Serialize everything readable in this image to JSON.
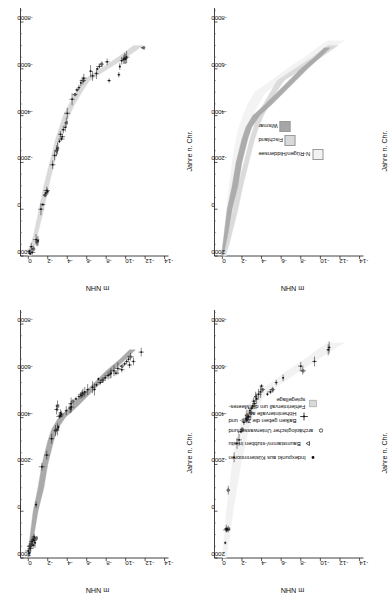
{
  "figure": {
    "axis_titles": {
      "x": "Jahre n. Chr.",
      "y": "m NHN"
    },
    "x_ticks": [
      "2000",
      "0",
      "-2000",
      "-4000",
      "-6000",
      "-8000"
    ],
    "x_tick_values": [
      2000,
      0,
      -2000,
      -4000,
      -6000,
      -8000
    ],
    "y_ticks": [
      "0",
      "-2",
      "-4",
      "-6",
      "-8",
      "-10",
      "-12",
      "-14"
    ],
    "y_tick_values": [
      0,
      -2,
      -4,
      -6,
      -8,
      -10,
      -12,
      -14
    ],
    "xlim": [
      2000,
      -8600
    ],
    "ylim": [
      0.8,
      -14.4
    ]
  },
  "panels": [
    {
      "id": "wismar",
      "title": "Wismar"
    },
    {
      "id": "fischland",
      "title": "Fischland"
    },
    {
      "id": "nruegen",
      "title": "N-Rügen/\nHiddensee"
    },
    {
      "id": "vergleich",
      "title": "Vergleich"
    }
  ],
  "legend_compare": {
    "items": [
      {
        "label": "N-Rügen/Hiddensee",
        "color": "#f2f2f2"
      },
      {
        "label": "Fischland",
        "color": "#d9d9d9"
      },
      {
        "label": "Wismar",
        "color": "#a6a6a6"
      }
    ]
  },
  "legend_symbols": {
    "items": [
      {
        "glyph": "dot",
        "label": "Indexpunkt aus Küstenmooren"
      },
      {
        "glyph": "triangle",
        "label": "Baumstamm/-stubben in situ"
      },
      {
        "glyph": "circle",
        "label": "archäologischer Unterwasserfund"
      },
      {
        "glyph": "cross",
        "label": "Balken geben die Zeit- und\nHöhenintervalle an"
      },
      {
        "glyph": "band",
        "label": "Fehlerintervall um die Meeres-\nspiegellage"
      }
    ]
  },
  "chart_data": {
    "type": "scatter",
    "xlabel": "Jahre n. Chr.",
    "ylabel": "m NHN",
    "xlim": [
      2000,
      -8600
    ],
    "ylim": [
      0.8,
      -14.4
    ],
    "grid": false,
    "legend_position": "inset",
    "series": [
      {
        "name": "Wismar",
        "panel": "wismar",
        "band_color": "#a6a6a6",
        "band_upper": [
          [
            2000,
            0.1
          ],
          [
            1000,
            -0.2
          ],
          [
            0,
            -0.5
          ],
          [
            -1000,
            -1.0
          ],
          [
            -2000,
            -1.4
          ],
          [
            -3000,
            -2.0
          ],
          [
            -3500,
            -2.4
          ],
          [
            -4000,
            -3.1
          ],
          [
            -4500,
            -4.4
          ],
          [
            -5000,
            -5.6
          ],
          [
            -5500,
            -6.8
          ],
          [
            -6000,
            -8.0
          ],
          [
            -6500,
            -9.4
          ],
          [
            -6900,
            -10.4
          ]
        ],
        "band_lower": [
          [
            2000,
            -0.1
          ],
          [
            1000,
            -0.6
          ],
          [
            0,
            -1.0
          ],
          [
            -1000,
            -1.6
          ],
          [
            -2000,
            -2.0
          ],
          [
            -3000,
            -2.6
          ],
          [
            -3500,
            -3.0
          ],
          [
            -4000,
            -3.8
          ],
          [
            -4500,
            -5.1
          ],
          [
            -5000,
            -6.3
          ],
          [
            -5500,
            -7.5
          ],
          [
            -6000,
            -8.7
          ],
          [
            -6500,
            -10.0
          ],
          [
            -6900,
            -11.0
          ]
        ],
        "points": [
          [
            1800,
            -0.1
          ],
          [
            1700,
            0.0
          ],
          [
            1600,
            -0.2
          ],
          [
            1500,
            -0.1
          ],
          [
            1450,
            -0.5
          ],
          [
            1400,
            -0.3
          ],
          [
            1350,
            -0.7
          ],
          [
            1300,
            -0.4
          ],
          [
            1250,
            -0.6
          ],
          [
            1200,
            -0.5
          ],
          [
            1150,
            -0.8
          ],
          [
            1100,
            -0.6
          ],
          [
            -280,
            -0.8
          ],
          [
            -1900,
            -1.4
          ],
          [
            -2400,
            -1.9
          ],
          [
            -3100,
            -2.4
          ],
          [
            -3450,
            -2.8
          ],
          [
            -3500,
            -3.0
          ],
          [
            -3600,
            -3.1
          ],
          [
            -4050,
            -3.2
          ],
          [
            -4100,
            -3.3
          ],
          [
            -4150,
            -3.4
          ],
          [
            -4200,
            -3.3
          ],
          [
            -4300,
            -3.9
          ],
          [
            -4400,
            -4.3
          ],
          [
            -4450,
            -4.4
          ],
          [
            -4600,
            -4.4
          ],
          [
            -4700,
            -4.6
          ],
          [
            -4800,
            -4.9
          ],
          [
            -4900,
            -5.2
          ],
          [
            -4950,
            -5.4
          ],
          [
            -5000,
            -5.5
          ],
          [
            -5050,
            -5.6
          ],
          [
            -5100,
            -5.8
          ],
          [
            -5200,
            -6.1
          ],
          [
            -5300,
            -6.6
          ],
          [
            -5400,
            -7.0
          ],
          [
            -5500,
            -7.4
          ],
          [
            -5600,
            -7.6
          ],
          [
            -5700,
            -7.9
          ],
          [
            -5800,
            -8.2
          ],
          [
            -5850,
            -8.4
          ],
          [
            -5900,
            -8.5
          ],
          [
            -6000,
            -8.8
          ],
          [
            -6100,
            -9.2
          ],
          [
            -6200,
            -9.6
          ],
          [
            -6300,
            -9.9
          ],
          [
            -6400,
            -10.1
          ],
          [
            -6500,
            -10.3
          ],
          [
            -6600,
            -10.5
          ],
          [
            -6800,
            -11.6
          ],
          [
            -4350,
            -2.9
          ],
          [
            -4500,
            -3.0
          ],
          [
            -5200,
            -6.8
          ],
          [
            -5650,
            -7.2
          ],
          [
            -5900,
            -9.0
          ],
          [
            -6050,
            -9.6
          ],
          [
            -6250,
            -10.4
          ],
          [
            -6400,
            -10.8
          ]
        ]
      },
      {
        "name": "Fischland",
        "panel": "fischland",
        "band_color": "#d9d9d9",
        "band_upper": [
          [
            2000,
            0.0
          ],
          [
            1500,
            -0.3
          ],
          [
            1000,
            -0.6
          ],
          [
            0,
            -1.1
          ],
          [
            -1000,
            -1.6
          ],
          [
            -2000,
            -2.2
          ],
          [
            -3000,
            -2.8
          ],
          [
            -3500,
            -3.2
          ],
          [
            -4000,
            -3.6
          ],
          [
            -4500,
            -4.2
          ],
          [
            -5000,
            -4.9
          ],
          [
            -5500,
            -5.6
          ],
          [
            -6000,
            -7.4
          ],
          [
            -6500,
            -9.2
          ],
          [
            -7000,
            -10.8
          ]
        ],
        "band_lower": [
          [
            2000,
            -0.3
          ],
          [
            1500,
            -0.7
          ],
          [
            1000,
            -1.0
          ],
          [
            0,
            -1.6
          ],
          [
            -1000,
            -2.1
          ],
          [
            -2000,
            -2.7
          ],
          [
            -3000,
            -3.3
          ],
          [
            -3500,
            -3.7
          ],
          [
            -4000,
            -4.2
          ],
          [
            -4500,
            -4.8
          ],
          [
            -5000,
            -5.5
          ],
          [
            -5500,
            -6.3
          ],
          [
            -6000,
            -8.2
          ],
          [
            -6500,
            -10.1
          ],
          [
            -7000,
            -11.8
          ]
        ],
        "points": [
          [
            1900,
            -0.2
          ],
          [
            1850,
            -0.4
          ],
          [
            1800,
            -0.1
          ],
          [
            1700,
            -0.5
          ],
          [
            1600,
            -0.3
          ],
          [
            1400,
            -0.9
          ],
          [
            1350,
            -1.0
          ],
          [
            1300,
            -0.8
          ],
          [
            0,
            -1.3
          ],
          [
            -200,
            -1.5
          ],
          [
            -600,
            -1.7
          ],
          [
            -700,
            -1.8
          ],
          [
            -750,
            -2.0
          ],
          [
            -800,
            -1.9
          ],
          [
            -1900,
            -2.5
          ],
          [
            -2300,
            -2.7
          ],
          [
            -2500,
            -2.9
          ],
          [
            -2600,
            -3.0
          ],
          [
            -2900,
            -3.2
          ],
          [
            -3000,
            -3.4
          ],
          [
            -3100,
            -3.5
          ],
          [
            -3200,
            -3.3
          ],
          [
            -3400,
            -3.6
          ],
          [
            -3500,
            -3.8
          ],
          [
            -3700,
            -3.9
          ],
          [
            -4100,
            -4.0
          ],
          [
            -4700,
            -4.5
          ],
          [
            -4900,
            -4.8
          ],
          [
            -5100,
            -5.0
          ],
          [
            -5200,
            -5.2
          ],
          [
            -5400,
            -5.4
          ],
          [
            -5500,
            -5.6
          ],
          [
            -5600,
            -5.7
          ],
          [
            -5700,
            -6.6
          ],
          [
            -5800,
            -7.0
          ],
          [
            -5900,
            -6.4
          ],
          [
            -6000,
            -7.1
          ],
          [
            -6100,
            -7.3
          ],
          [
            -6200,
            -7.5
          ],
          [
            -6300,
            -8.1
          ],
          [
            -6350,
            -9.6
          ],
          [
            -6400,
            -9.8
          ],
          [
            -6420,
            -10.0
          ],
          [
            -6450,
            -9.9
          ],
          [
            -6500,
            -10.1
          ],
          [
            -6900,
            -11.8
          ],
          [
            -5500,
            -8.3
          ],
          [
            -5750,
            -9.3
          ],
          [
            -6100,
            -9.4
          ]
        ]
      },
      {
        "name": "N-Rügen/Hiddensee",
        "panel": "nruegen",
        "band_color": "#f2f2f2",
        "band_upper": [
          [
            2000,
            0.0
          ],
          [
            1000,
            -0.2
          ],
          [
            0,
            -0.4
          ],
          [
            -1000,
            -0.7
          ],
          [
            -2000,
            -1.0
          ],
          [
            -3000,
            -1.4
          ],
          [
            -3500,
            -1.7
          ],
          [
            -4000,
            -2.1
          ],
          [
            -4500,
            -2.6
          ],
          [
            -5000,
            -3.3
          ],
          [
            -5500,
            -5.0
          ],
          [
            -6000,
            -6.6
          ],
          [
            -6500,
            -8.4
          ],
          [
            -7000,
            -10.0
          ],
          [
            -7200,
            -10.8
          ]
        ],
        "band_lower": [
          [
            2000,
            -0.4
          ],
          [
            1000,
            -0.8
          ],
          [
            0,
            -1.1
          ],
          [
            -1000,
            -1.5
          ],
          [
            -2000,
            -1.9
          ],
          [
            -3000,
            -2.4
          ],
          [
            -3500,
            -2.7
          ],
          [
            -4000,
            -3.1
          ],
          [
            -4500,
            -3.7
          ],
          [
            -5000,
            -4.4
          ],
          [
            -5500,
            -6.2
          ],
          [
            -6000,
            -7.9
          ],
          [
            -6500,
            -9.8
          ],
          [
            -7000,
            -11.6
          ],
          [
            -7200,
            -12.5
          ]
        ],
        "points": [
          [
            1350,
            -0.3
          ],
          [
            800,
            -0.4
          ],
          [
            780,
            -0.5
          ],
          [
            760,
            -0.6
          ],
          [
            740,
            -0.4
          ],
          [
            -900,
            -0.6
          ],
          [
            -2300,
            -1.2
          ],
          [
            -2900,
            -1.5
          ],
          [
            -3050,
            -1.7
          ],
          [
            -3400,
            -1.9
          ],
          [
            -3500,
            -2.0
          ],
          [
            -3800,
            -2.2
          ],
          [
            -3900,
            -2.5
          ],
          [
            -3950,
            -2.4
          ],
          [
            -4000,
            -2.6
          ],
          [
            -4050,
            -2.7
          ],
          [
            -4100,
            -2.5
          ],
          [
            -4200,
            -2.9
          ],
          [
            -4300,
            -2.8
          ],
          [
            -4400,
            -3.0
          ],
          [
            -4500,
            -3.1
          ],
          [
            -4600,
            -3.3
          ],
          [
            -4700,
            -3.2
          ],
          [
            -4800,
            -3.5
          ],
          [
            -4900,
            -3.4
          ],
          [
            -5000,
            -3.7
          ],
          [
            -5100,
            -3.9
          ],
          [
            -5200,
            -4.1
          ],
          [
            -5350,
            -4.0
          ],
          [
            -5500,
            -5.5
          ],
          [
            -5700,
            -6.2
          ],
          [
            -6000,
            -8.2
          ],
          [
            -6200,
            -8.0
          ],
          [
            -6400,
            -9.4
          ],
          [
            -6900,
            -10.8
          ],
          [
            -7000,
            -10.9
          ],
          [
            -5000,
            -4.6
          ],
          [
            -5100,
            -4.9
          ],
          [
            -5200,
            -5.1
          ]
        ]
      }
    ],
    "comparison_panel": {
      "panel": "vergleich",
      "bands": [
        {
          "name": "N-Rügen/Hiddensee",
          "color": "#f2f2f2"
        },
        {
          "name": "Fischland",
          "color": "#d9d9d9"
        },
        {
          "name": "Wismar",
          "color": "#a6a6a6"
        }
      ]
    }
  }
}
